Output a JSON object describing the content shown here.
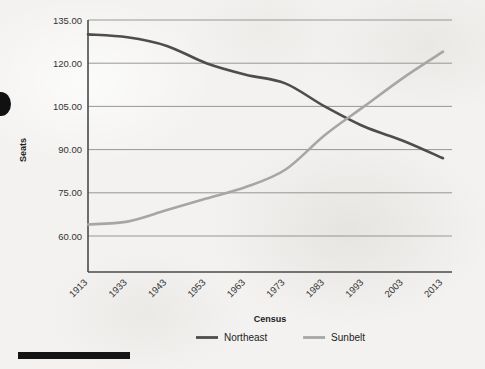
{
  "chart_data": {
    "type": "line",
    "title": "",
    "xlabel": "Census",
    "ylabel": "Seats",
    "categories": [
      "1913",
      "1933",
      "1943",
      "1953",
      "1963",
      "1973",
      "1983",
      "1993",
      "2003",
      "2013"
    ],
    "ytick_labels": [
      "135.00",
      "120.00",
      "105.00",
      "90.00",
      "75.00",
      "60.00"
    ],
    "ytick_values": [
      135,
      120,
      105,
      90,
      75,
      60
    ],
    "ylim": [
      52,
      135
    ],
    "grid": "horizontal",
    "legend_position": "bottom",
    "series": [
      {
        "name": "Northeast",
        "color": "#4d4d4d",
        "values": [
          130,
          129,
          126,
          120,
          116,
          113,
          105,
          98,
          93,
          87
        ]
      },
      {
        "name": "Sunbelt",
        "color": "#a6a6a6",
        "values": [
          64,
          65,
          69,
          73,
          77,
          83,
          95,
          105,
          115,
          124
        ]
      }
    ]
  },
  "artifacts": {
    "edge_blob_name": "page-edge-smudge",
    "bottom_bar_name": "page-bottom-black-bar"
  }
}
